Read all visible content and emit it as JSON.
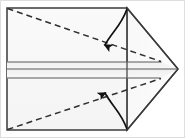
{
  "figure": {
    "description": "A rectangular sheet of paper with a triangular flap folded to the right point; two dashed diagonal crease lines and two curved fold arrows indicate the top and bottom corners folding inward toward the horizontal center band.",
    "type": "origami-fold-instruction",
    "canvas": {
      "width": 185,
      "height": 138,
      "background": "#ffffff",
      "outer_border_color": "#d8d8d8"
    },
    "colors": {
      "paper_fill": "#f7f7f7",
      "paper_fill_alt": "#fbfbfb",
      "band_fill": "#f2f2f2",
      "outline": "#3a3a3a",
      "band_line": "#8a8a8a",
      "crease_dashed": "#2f2f2f",
      "arrow": "#111111"
    },
    "geometry": {
      "rect": {
        "left": 7,
        "top": 8,
        "right": 127,
        "bottom": 130
      },
      "apex": {
        "x": 178,
        "y": 69
      },
      "band_lines_y": [
        62,
        69,
        78
      ],
      "fold_line_x": 127
    },
    "shapes": [
      {
        "name": "paper-body-rectangle",
        "kind": "rect",
        "label": "Main rectangular sheet"
      },
      {
        "name": "triangle-flap",
        "kind": "triangle",
        "label": "Right-pointing triangular flap"
      },
      {
        "name": "center-band-upper",
        "kind": "band",
        "label": "Upper horizontal band"
      },
      {
        "name": "center-band-lower",
        "kind": "band",
        "label": "Lower horizontal band"
      },
      {
        "name": "vertical-fold-line",
        "kind": "line",
        "label": "Vertical fold line at x=127"
      }
    ],
    "creases": [
      {
        "name": "crease-top",
        "from": [
          7,
          8
        ],
        "to": [
          161,
          61
        ],
        "style": "dashed",
        "label": "Top diagonal crease"
      },
      {
        "name": "crease-bottom",
        "from": [
          7,
          130
        ],
        "to": [
          161,
          78
        ],
        "style": "dashed",
        "label": "Bottom diagonal crease"
      }
    ],
    "arrows": [
      {
        "name": "fold-arrow-top",
        "direction": "down",
        "from": [
          127,
          9
        ],
        "to": [
          103,
          53
        ],
        "label": "Fold top corner down"
      },
      {
        "name": "fold-arrow-bottom",
        "direction": "up",
        "from": [
          127,
          129
        ],
        "to": [
          103,
          85
        ],
        "label": "Fold bottom corner up"
      }
    ]
  }
}
